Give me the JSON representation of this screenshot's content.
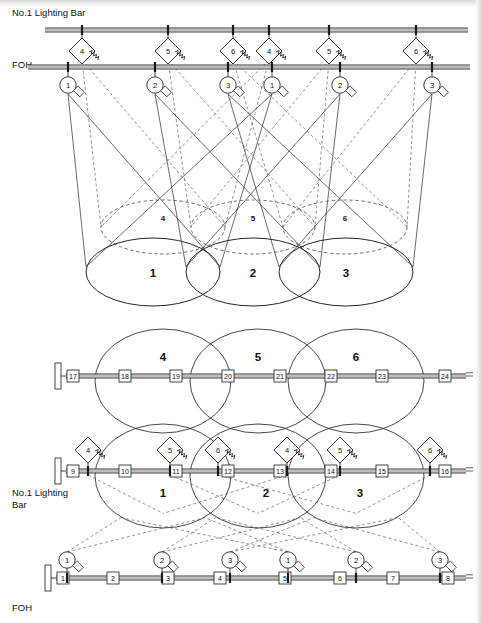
{
  "figure": {
    "stroke_color": "#1a1a1a",
    "dash_color": "#4a4a4a",
    "bar_fill": "#bdbdbd"
  },
  "labels": {
    "elevation_lighting_bar": "No.1 Lighting Bar",
    "elevation_foh": "FOH",
    "plan_lighting_bar_line1": "No.1 Lighting",
    "plan_lighting_bar_line2": "Bar",
    "plan_foh": "FOH"
  },
  "elevation": {
    "lighting_bar": {
      "y": 30,
      "x_start": 45,
      "x_end": 468,
      "fixtures": [
        {
          "x": 82,
          "label": "4",
          "type": "fresnel"
        },
        {
          "x": 168,
          "label": "5",
          "type": "fresnel"
        },
        {
          "x": 233,
          "label": "6",
          "type": "fresnel"
        },
        {
          "x": 269,
          "label": "4",
          "type": "fresnel"
        },
        {
          "x": 329,
          "label": "5",
          "type": "fresnel"
        },
        {
          "x": 416,
          "label": "6",
          "type": "fresnel"
        }
      ]
    },
    "foh_bar": {
      "y": 67,
      "x_start": 28,
      "x_end": 470,
      "fixtures": [
        {
          "x": 68,
          "label": "1",
          "type": "profile"
        },
        {
          "x": 155,
          "label": "2",
          "type": "profile"
        },
        {
          "x": 228,
          "label": "3",
          "type": "profile"
        },
        {
          "x": 272,
          "label": "1",
          "type": "profile"
        },
        {
          "x": 340,
          "label": "2",
          "type": "profile"
        },
        {
          "x": 432,
          "label": "3",
          "type": "profile"
        }
      ]
    },
    "pools_solid": [
      {
        "cx": 153,
        "cy": 272,
        "rx": 67,
        "ry": 34,
        "label": "1"
      },
      {
        "cx": 253,
        "cy": 272,
        "rx": 67,
        "ry": 34,
        "label": "2"
      },
      {
        "cx": 346,
        "cy": 272,
        "rx": 67,
        "ry": 34,
        "label": "3"
      }
    ],
    "pools_dashed": [
      {
        "cx": 163,
        "cy": 227,
        "rx": 62,
        "ry": 27,
        "label": "4"
      },
      {
        "cx": 253,
        "cy": 227,
        "rx": 62,
        "ry": 27,
        "label": "5"
      },
      {
        "cx": 345,
        "cy": 227,
        "rx": 62,
        "ry": 27,
        "label": "6"
      }
    ]
  },
  "plan": {
    "upper_bar": {
      "y": 376,
      "x_start": 66,
      "x_end": 466,
      "boxes": [
        "17",
        "18",
        "19",
        "20",
        "21",
        "22",
        "23",
        "24"
      ],
      "box_x": [
        73,
        125,
        176,
        228,
        280,
        331,
        382,
        445
      ]
    },
    "middle_bar": {
      "y": 471,
      "x_start": 66,
      "x_end": 466,
      "boxes": [
        "9",
        "10",
        "11",
        "12",
        "13",
        "14",
        "15",
        "16"
      ],
      "box_x": [
        73,
        125,
        176,
        228,
        280,
        331,
        382,
        445
      ],
      "fixtures": [
        {
          "x": 88,
          "label": "4",
          "type": "fresnel"
        },
        {
          "x": 170,
          "label": "5",
          "type": "fresnel"
        },
        {
          "x": 218,
          "label": "6",
          "type": "fresnel"
        },
        {
          "x": 287,
          "label": "4",
          "type": "fresnel"
        },
        {
          "x": 340,
          "label": "5",
          "type": "fresnel"
        },
        {
          "x": 430,
          "label": "6",
          "type": "fresnel"
        }
      ]
    },
    "lower_bar": {
      "y": 578,
      "x_start": 56,
      "x_end": 466,
      "boxes": [
        "1",
        "2",
        "3",
        "4",
        "5",
        "6",
        "7",
        "8"
      ],
      "box_x": [
        63,
        113,
        168,
        220,
        285,
        340,
        393,
        448
      ],
      "fixtures": [
        {
          "x": 67,
          "label": "1",
          "type": "profile"
        },
        {
          "x": 162,
          "label": "2",
          "type": "profile"
        },
        {
          "x": 230,
          "label": "3",
          "type": "profile"
        },
        {
          "x": 288,
          "label": "1",
          "type": "profile"
        },
        {
          "x": 356,
          "label": "2",
          "type": "profile"
        },
        {
          "x": 440,
          "label": "3",
          "type": "profile"
        }
      ]
    },
    "circles_upper": [
      {
        "cx": 163,
        "cy": 381,
        "rx": 68,
        "ry": 52,
        "label": "4",
        "label_x": 163,
        "label_y": 361
      },
      {
        "cx": 258,
        "cy": 381,
        "rx": 68,
        "ry": 52,
        "label": "5",
        "label_x": 258,
        "label_y": 361
      },
      {
        "cx": 356,
        "cy": 381,
        "rx": 68,
        "ry": 52,
        "label": "6",
        "label_x": 356,
        "label_y": 361
      }
    ],
    "circles_lower": [
      {
        "cx": 163,
        "cy": 476,
        "rx": 68,
        "ry": 52,
        "label": "1",
        "label_x": 163,
        "label_y": 497
      },
      {
        "cx": 258,
        "cy": 476,
        "rx": 68,
        "ry": 52,
        "label": "2",
        "label_x": 266,
        "label_y": 497
      },
      {
        "cx": 356,
        "cy": 476,
        "rx": 68,
        "ry": 52,
        "label": "3",
        "label_x": 360,
        "label_y": 497
      }
    ]
  }
}
